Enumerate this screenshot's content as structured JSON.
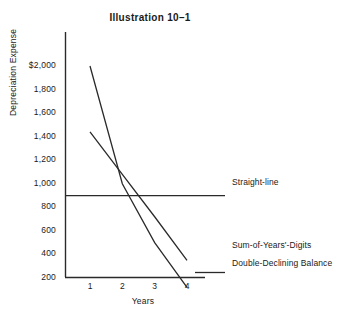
{
  "chart_data": {
    "type": "line",
    "title": "Illustration 10–1",
    "xlabel": "Years",
    "ylabel": "Depreciation Expense",
    "x": [
      1,
      2,
      3,
      4
    ],
    "xticklabels": [
      "1",
      "2",
      "3",
      "4"
    ],
    "yticks": [
      2000,
      1800,
      1600,
      1400,
      1200,
      1000,
      800,
      600,
      400,
      200
    ],
    "yticklabels": [
      "$2,000",
      "1,800",
      "1,600",
      "1,400",
      "1,200",
      "1,000",
      "800",
      "600",
      "400",
      "200"
    ],
    "xlim": [
      0.3,
      4.6
    ],
    "ylim": [
      60,
      2280
    ],
    "grid": false,
    "legend_position": "right-inline",
    "series": [
      {
        "name": "Straight-line",
        "label": "Straight-line",
        "values": [
          900,
          900,
          900,
          900
        ],
        "extends_past_axis": true
      },
      {
        "name": "Sum-of-Years'-Digits",
        "label": "Sum-of-Years'-Digits",
        "values": [
          1440,
          1080,
          720,
          350
        ]
      },
      {
        "name": "Double-Declining Balance",
        "label": "Double-Declining Balance",
        "values": [
          2000,
          1000,
          500,
          120
        ]
      }
    ],
    "annotations": []
  }
}
